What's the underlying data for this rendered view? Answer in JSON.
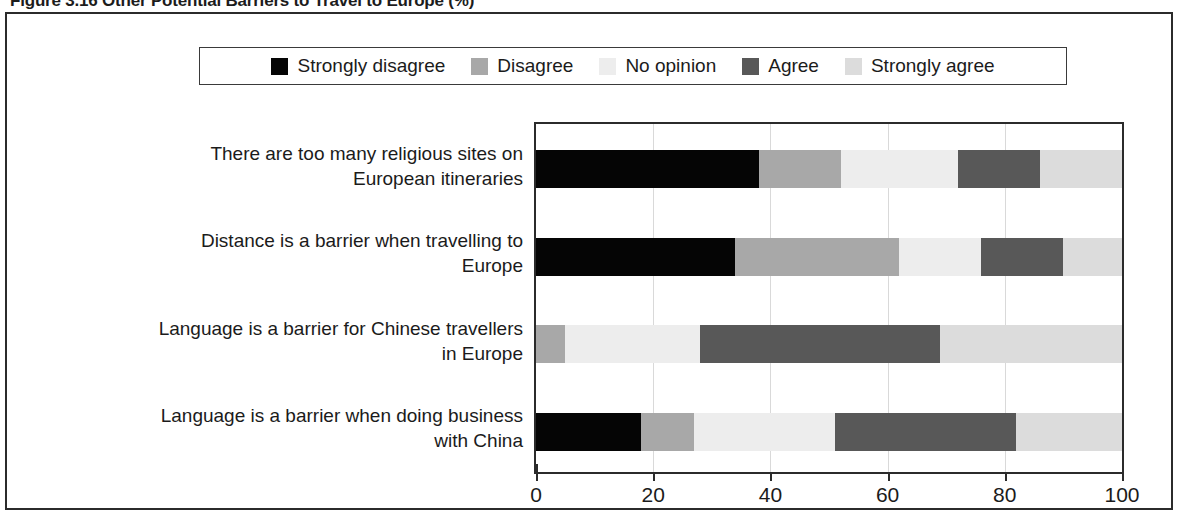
{
  "figure": {
    "title": "Figure 3.16  Other Potential Barriers to Travel to Europe (%)"
  },
  "legend": {
    "items": [
      {
        "label": "Strongly disagree",
        "color": "#050505",
        "swatch": "legend-swatch-strongly-disagree"
      },
      {
        "label": "Disagree",
        "color": "#a8a8a8",
        "swatch": "legend-swatch-disagree"
      },
      {
        "label": "No opinion",
        "color": "#ededed",
        "swatch": "legend-swatch-no-opinion"
      },
      {
        "label": "Agree",
        "color": "#585858",
        "swatch": "legend-swatch-agree"
      },
      {
        "label": "Strongly agree",
        "color": "#dcdcdc",
        "swatch": "legend-swatch-strongly-agree"
      }
    ]
  },
  "axis": {
    "x_ticks": [
      "0",
      "20",
      "40",
      "60",
      "80",
      "100"
    ],
    "x_min": 0,
    "x_max": 100
  },
  "chart_data": {
    "type": "bar",
    "orientation": "horizontal",
    "stacked": true,
    "stacked_100": true,
    "title": "Figure 3.16  Other Potential Barriers to Travel to Europe (%)",
    "xlabel": "",
    "ylabel": "",
    "xlim": [
      0,
      100
    ],
    "xticks": [
      0,
      20,
      40,
      60,
      80,
      100
    ],
    "grid": "vertical",
    "legend_position": "top",
    "categories": [
      "There are too many religious sites on European itineraries",
      "Distance is a barrier when travelling to Europe",
      "Language is a barrier for Chinese travellers in Europe",
      "Language is a barrier when doing business with China"
    ],
    "category_lines": [
      [
        "There are too many religious sites on",
        "European itineraries"
      ],
      [
        "Distance is a barrier when travelling to",
        "Europe"
      ],
      [
        "Language is a barrier for Chinese travellers",
        "in Europe"
      ],
      [
        "Language is a barrier when doing business",
        "with China"
      ]
    ],
    "series": [
      {
        "name": "Strongly disagree",
        "color": "#050505",
        "values": [
          38,
          34,
          0,
          18
        ]
      },
      {
        "name": "Disagree",
        "color": "#a8a8a8",
        "values": [
          14,
          28,
          5,
          9
        ]
      },
      {
        "name": "No opinion",
        "color": "#ededed",
        "values": [
          20,
          14,
          23,
          24
        ]
      },
      {
        "name": "Agree",
        "color": "#585858",
        "values": [
          14,
          14,
          41,
          31
        ]
      },
      {
        "name": "Strongly agree",
        "color": "#dcdcdc",
        "values": [
          14,
          10,
          31,
          18
        ]
      }
    ]
  }
}
